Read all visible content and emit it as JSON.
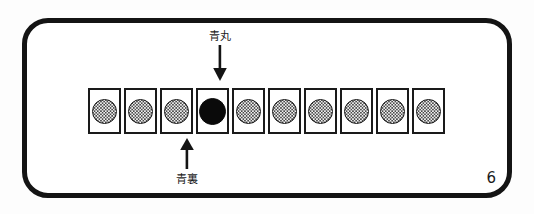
{
  "figure": {
    "page_number": "6",
    "frame_color": "#141414",
    "background_color": "#ffffff"
  },
  "annotations": {
    "top": {
      "label": "青丸",
      "icon": "arrow-down-icon",
      "points_to_tile_index": 4
    },
    "bottom": {
      "label": "青裏",
      "icon": "arrow-up-icon",
      "points_to_tile_index": 3
    }
  },
  "tile_strip": {
    "count": 10,
    "tiles": [
      {
        "index": 1,
        "stone": "stippled",
        "color": "#f2f2f2"
      },
      {
        "index": 2,
        "stone": "stippled",
        "color": "#f2f2f2"
      },
      {
        "index": 3,
        "stone": "stippled",
        "color": "#f2f2f2"
      },
      {
        "index": 4,
        "stone": "solid",
        "color": "#0a0a0a"
      },
      {
        "index": 5,
        "stone": "stippled",
        "color": "#f2f2f2"
      },
      {
        "index": 6,
        "stone": "stippled",
        "color": "#f2f2f2"
      },
      {
        "index": 7,
        "stone": "stippled",
        "color": "#f2f2f2"
      },
      {
        "index": 8,
        "stone": "stippled",
        "color": "#f2f2f2"
      },
      {
        "index": 9,
        "stone": "stippled",
        "color": "#f2f2f2"
      },
      {
        "index": 10,
        "stone": "stippled",
        "color": "#f2f2f2"
      }
    ]
  }
}
